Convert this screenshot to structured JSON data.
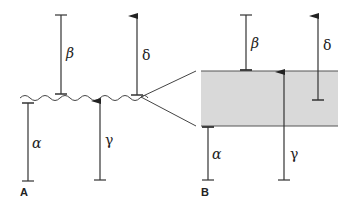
{
  "panels": [
    {
      "id": "A",
      "label": "A",
      "description": "membrane drawn as wavy line",
      "vectors": [
        {
          "name": "alpha",
          "symbol": "α",
          "type": "bar",
          "direction": "below"
        },
        {
          "name": "beta",
          "symbol": "β",
          "type": "bar",
          "direction": "above"
        },
        {
          "name": "gamma",
          "symbol": "γ",
          "type": "arrow",
          "direction": "up-through"
        },
        {
          "name": "delta",
          "symbol": "δ",
          "type": "arrow",
          "direction": "up-from-membrane"
        }
      ]
    },
    {
      "id": "B",
      "label": "B",
      "description": "magnified membrane drawn as shaded slab",
      "vectors": [
        {
          "name": "alpha",
          "symbol": "α",
          "type": "bar",
          "direction": "below"
        },
        {
          "name": "beta",
          "symbol": "β",
          "type": "bar",
          "direction": "above"
        },
        {
          "name": "gamma",
          "symbol": "γ",
          "type": "arrow",
          "direction": "up-through"
        },
        {
          "name": "delta",
          "symbol": "δ",
          "type": "arrow",
          "direction": "up-from-inside"
        }
      ]
    }
  ],
  "colors": {
    "line": "#333333",
    "slab_fill": "#d9d9d9",
    "slab_border": "#555555"
  }
}
